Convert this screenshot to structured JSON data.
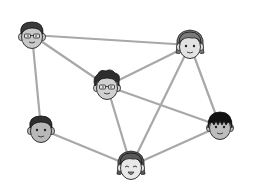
{
  "diagram": {
    "type": "social-network",
    "background": "#ffffff",
    "edge_color": "#a8a8a8",
    "edge_width": 2.2,
    "nodes": [
      {
        "id": "A",
        "label": "man-with-glasses",
        "x": 32,
        "y": 35,
        "hair": "#3a3a3a",
        "skin": "#c8c8c8",
        "glasses": true,
        "style": "short"
      },
      {
        "id": "B",
        "label": "messy-hair-man-with-glasses",
        "x": 107,
        "y": 86,
        "hair": "#2e2e2e",
        "skin": "#d0d0d0",
        "glasses": true,
        "style": "messy"
      },
      {
        "id": "C",
        "label": "woman",
        "x": 190,
        "y": 45,
        "hair": "#7a7a7a",
        "skin": "#e2e2e2",
        "glasses": false,
        "style": "bob"
      },
      {
        "id": "D",
        "label": "smiling-man",
        "x": 41,
        "y": 129,
        "hair": "#2f2f2f",
        "skin": "#b8b8b8",
        "glasses": false,
        "style": "short"
      },
      {
        "id": "E",
        "label": "black-hair-boy",
        "x": 220,
        "y": 126,
        "hair": "#111111",
        "skin": "#bdbdbd",
        "glasses": false,
        "style": "bowl"
      },
      {
        "id": "F",
        "label": "laughing-woman",
        "x": 131,
        "y": 166,
        "hair": "#5a5a5a",
        "skin": "#e8e8e8",
        "glasses": false,
        "style": "bob-happy"
      }
    ],
    "edges": [
      [
        "A",
        "C"
      ],
      [
        "A",
        "B"
      ],
      [
        "A",
        "D"
      ],
      [
        "B",
        "C"
      ],
      [
        "B",
        "F"
      ],
      [
        "B",
        "E"
      ],
      [
        "C",
        "F"
      ],
      [
        "C",
        "E"
      ],
      [
        "D",
        "F"
      ],
      [
        "E",
        "F"
      ]
    ]
  }
}
